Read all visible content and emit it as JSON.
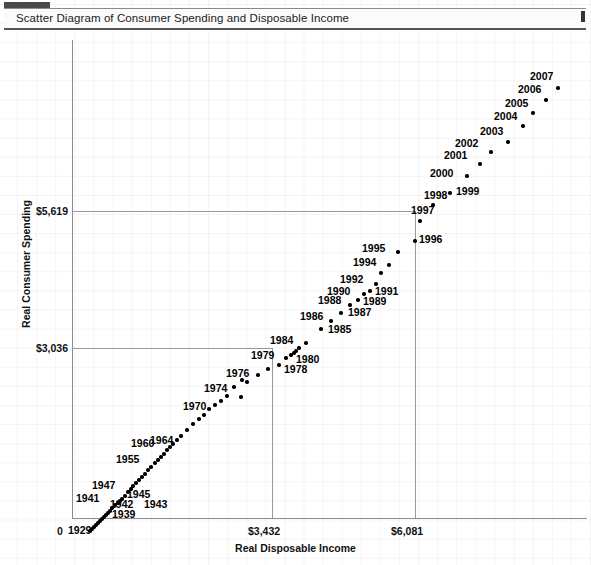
{
  "window": {
    "title": "Scatter Diagram of Consumer Spending and Disposable Income"
  },
  "chart_data": {
    "type": "scatter",
    "title": "Scatter Diagram of Consumer Spending and Disposable Income",
    "xlabel": "Real Disposable Income",
    "ylabel": "Real Consumer Spending",
    "grid": true,
    "legend": "none",
    "xticks": [
      "0",
      "$3,432",
      "$6,081"
    ],
    "xtick_values": [
      0,
      3432,
      6081
    ],
    "yticks": [
      "$3,036",
      "$5,619"
    ],
    "ytick_values": [
      3036,
      5619
    ],
    "xlim": [
      0,
      7600
    ],
    "ylim": [
      0,
      8100
    ],
    "reference_lines": {
      "x": 3432,
      "y": 5619,
      "note": "gridlines meet at the 1996 observation"
    },
    "point_labels_shown": [
      "1929",
      "1939",
      "1941",
      "1942",
      "1943",
      "1945",
      "1947",
      "1955",
      "1960",
      "1964",
      "1970",
      "1974",
      "1976",
      "1978",
      "1979",
      "1980",
      "1984",
      "1985",
      "1986",
      "1987",
      "1988",
      "1989",
      "1990",
      "1991",
      "1992",
      "1994",
      "1995",
      "1996",
      "1997",
      "1998",
      "1999",
      "2000",
      "2001",
      "2002",
      "2003",
      "2004",
      "2005",
      "2006",
      "2007"
    ],
    "points": [
      {
        "year": "1929",
        "x": 780,
        "y": 750,
        "px": 90,
        "py": 501,
        "label": "1929",
        "lx": 68,
        "ly": 500,
        "lw": 30
      },
      {
        "year": "1930",
        "x": 800,
        "y": 770,
        "px": 92,
        "py": 499,
        "label": null
      },
      {
        "year": "1931",
        "x": 820,
        "y": 790,
        "px": 94,
        "py": 497,
        "label": null
      },
      {
        "year": "1932",
        "x": 840,
        "y": 810,
        "px": 96,
        "py": 495,
        "label": null
      },
      {
        "year": "1933",
        "x": 860,
        "y": 830,
        "px": 98,
        "py": 493,
        "label": null
      },
      {
        "year": "1934",
        "x": 885,
        "y": 855,
        "px": 100,
        "py": 491,
        "label": null
      },
      {
        "year": "1935",
        "x": 910,
        "y": 880,
        "px": 102,
        "py": 489,
        "label": null
      },
      {
        "year": "1936",
        "x": 935,
        "y": 905,
        "px": 104,
        "py": 487,
        "label": null
      },
      {
        "year": "1937",
        "x": 960,
        "y": 930,
        "px": 106,
        "py": 485,
        "label": null
      },
      {
        "year": "1938",
        "x": 985,
        "y": 955,
        "px": 108,
        "py": 483,
        "label": null
      },
      {
        "year": "1939",
        "x": 1010,
        "y": 980,
        "px": 110,
        "py": 481,
        "label": "1939",
        "lx": 112,
        "ly": 484,
        "lw": 30
      },
      {
        "year": "1940",
        "x": 1040,
        "y": 1010,
        "px": 112,
        "py": 478,
        "label": null
      },
      {
        "year": "1941",
        "x": 1070,
        "y": 1040,
        "px": 115,
        "py": 475,
        "label": "1941",
        "lx": 76,
        "ly": 468,
        "lw": 30
      },
      {
        "year": "1942",
        "x": 1105,
        "y": 1060,
        "px": 118,
        "py": 473,
        "label": "1942",
        "lx": 110,
        "ly": 474,
        "lw": 30
      },
      {
        "year": "1943",
        "x": 1125,
        "y": 1075,
        "px": 120,
        "py": 471,
        "label": "1943",
        "lx": 144,
        "ly": 474,
        "lw": 30
      },
      {
        "year": "1944",
        "x": 1150,
        "y": 1095,
        "px": 122,
        "py": 469,
        "label": null
      },
      {
        "year": "1945",
        "x": 1180,
        "y": 1125,
        "px": 125,
        "py": 466,
        "label": "1945",
        "lx": 127,
        "ly": 464,
        "lw": 30
      },
      {
        "year": "1946",
        "x": 1215,
        "y": 1160,
        "px": 128,
        "py": 462,
        "label": null
      },
      {
        "year": "1947",
        "x": 1245,
        "y": 1190,
        "px": 131,
        "py": 459,
        "label": "1947",
        "lx": 92,
        "ly": 455,
        "lw": 30
      },
      {
        "year": "1948",
        "x": 1275,
        "y": 1215,
        "px": 133,
        "py": 456,
        "label": null
      },
      {
        "year": "1949",
        "x": 1300,
        "y": 1240,
        "px": 136,
        "py": 453,
        "label": null
      },
      {
        "year": "1950",
        "x": 1335,
        "y": 1275,
        "px": 139,
        "py": 450,
        "label": null
      },
      {
        "year": "1951",
        "x": 1370,
        "y": 1300,
        "px": 142,
        "py": 447,
        "label": null
      },
      {
        "year": "1952",
        "x": 1400,
        "y": 1330,
        "px": 145,
        "py": 444,
        "label": null
      },
      {
        "year": "1953",
        "x": 1435,
        "y": 1365,
        "px": 148,
        "py": 440,
        "label": null
      },
      {
        "year": "1954",
        "x": 1465,
        "y": 1395,
        "px": 151,
        "py": 437,
        "label": null
      },
      {
        "year": "1955",
        "x": 1505,
        "y": 1440,
        "px": 155,
        "py": 433,
        "label": "1955",
        "lx": 116,
        "ly": 429,
        "lw": 30
      },
      {
        "year": "1956",
        "x": 1545,
        "y": 1470,
        "px": 158,
        "py": 430,
        "label": null
      },
      {
        "year": "1957",
        "x": 1575,
        "y": 1500,
        "px": 161,
        "py": 427,
        "label": null
      },
      {
        "year": "1958",
        "x": 1600,
        "y": 1525,
        "px": 164,
        "py": 424,
        "label": null
      },
      {
        "year": "1959",
        "x": 1640,
        "y": 1565,
        "px": 167,
        "py": 420,
        "label": null
      },
      {
        "year": "1960",
        "x": 1670,
        "y": 1595,
        "px": 170,
        "py": 417,
        "label": "1960",
        "lx": 131,
        "ly": 413,
        "lw": 30
      },
      {
        "year": "1961",
        "x": 1705,
        "y": 1625,
        "px": 173,
        "py": 414,
        "label": null
      },
      {
        "year": "1962",
        "x": 1750,
        "y": 1670,
        "px": 177,
        "py": 410,
        "label": null
      },
      {
        "year": "1963",
        "x": 1790,
        "y": 1710,
        "px": 181,
        "py": 406,
        "label": null
      },
      {
        "year": "1964",
        "x": 1860,
        "y": 1775,
        "px": 187,
        "py": 400,
        "label": "1964",
        "lx": 150,
        "ly": 410,
        "lw": 30
      },
      {
        "year": "1965",
        "x": 1930,
        "y": 1845,
        "px": 193,
        "py": 394,
        "label": null
      },
      {
        "year": "1966",
        "x": 1995,
        "y": 1905,
        "px": 199,
        "py": 389,
        "label": null
      },
      {
        "year": "1967",
        "x": 2050,
        "y": 1950,
        "px": 204,
        "py": 385,
        "label": null
      },
      {
        "year": "1968",
        "x": 2110,
        "y": 2015,
        "px": 209,
        "py": 379,
        "label": null
      },
      {
        "year": "1969",
        "x": 2170,
        "y": 2065,
        "px": 215,
        "py": 375,
        "label": null
      },
      {
        "year": "1970",
        "x": 2240,
        "y": 2105,
        "px": 221,
        "py": 371,
        "label": "1970",
        "lx": 183,
        "ly": 376,
        "lw": 30
      },
      {
        "year": "1971",
        "x": 2310,
        "y": 2165,
        "px": 227,
        "py": 366,
        "label": null
      },
      {
        "year": "1972",
        "x": 2400,
        "y": 2265,
        "px": 234,
        "py": 357,
        "label": null
      },
      {
        "year": "1973",
        "x": 2500,
        "y": 2350,
        "px": 242,
        "py": 350,
        "label": null
      },
      {
        "year": "1974",
        "x": 2490,
        "y": 2330,
        "px": 241,
        "py": 367,
        "label": "1974",
        "lx": 204,
        "ly": 358,
        "lw": 30
      },
      {
        "year": "1975",
        "x": 2530,
        "y": 2370,
        "px": 247,
        "py": 352,
        "label": null
      },
      {
        "year": "1976",
        "x": 2630,
        "y": 2475,
        "px": 258,
        "py": 345,
        "label": "1976",
        "lx": 226,
        "ly": 343,
        "lw": 30
      },
      {
        "year": "1977",
        "x": 2720,
        "y": 2565,
        "px": 268,
        "py": 339,
        "label": null
      },
      {
        "year": "1978",
        "x": 2830,
        "y": 2670,
        "px": 279,
        "py": 335,
        "label": "1978",
        "lx": 284,
        "ly": 339,
        "lw": 30
      },
      {
        "year": "1979",
        "x": 2890,
        "y": 2740,
        "px": 286,
        "py": 328,
        "label": "1979",
        "lx": 251,
        "ly": 325,
        "lw": 30
      },
      {
        "year": "1980",
        "x": 2900,
        "y": 2730,
        "px": 291,
        "py": 325,
        "label": "1980",
        "lx": 296,
        "ly": 329,
        "lw": 30
      },
      {
        "year": "1981",
        "x": 2940,
        "y": 2760,
        "px": 294,
        "py": 323,
        "label": null
      },
      {
        "year": "1982",
        "x": 2960,
        "y": 2790,
        "px": 296,
        "py": 321,
        "label": null
      },
      {
        "year": "1983",
        "x": 3010,
        "y": 2865,
        "px": 299,
        "py": 318,
        "label": null
      },
      {
        "year": "1984",
        "x": 3100,
        "y": 2960,
        "px": 306,
        "py": 313,
        "label": "1984",
        "lx": 270,
        "ly": 310,
        "lw": 30
      },
      {
        "year": "1985",
        "x": 3230,
        "y": 3060,
        "px": 321,
        "py": 299,
        "label": "1985",
        "lx": 328,
        "ly": 299,
        "lw": 30
      },
      {
        "year": "1986",
        "x": 3320,
        "y": 3180,
        "px": 331,
        "py": 291,
        "label": "1986",
        "lx": 300,
        "ly": 286,
        "lw": 30
      },
      {
        "year": "1987",
        "x": 3410,
        "y": 3280,
        "px": 341,
        "py": 283,
        "label": "1987",
        "lx": 348,
        "ly": 282,
        "lw": 30
      },
      {
        "year": "1988",
        "x": 3520,
        "y": 3395,
        "px": 350,
        "py": 275,
        "label": "1988",
        "lx": 318,
        "ly": 270,
        "lw": 30
      },
      {
        "year": "1989",
        "x": 3600,
        "y": 3460,
        "px": 358,
        "py": 270,
        "label": "1989",
        "lx": 363,
        "ly": 271,
        "lw": 30
      },
      {
        "year": "1990",
        "x": 3680,
        "y": 3520,
        "px": 364,
        "py": 264,
        "label": "1990",
        "lx": 327,
        "ly": 261,
        "lw": 30
      },
      {
        "year": "1991",
        "x": 3700,
        "y": 3525,
        "px": 370,
        "py": 261,
        "label": "1991",
        "lx": 375,
        "ly": 261,
        "lw": 30
      },
      {
        "year": "1992",
        "x": 3790,
        "y": 3610,
        "px": 376,
        "py": 254,
        "label": "1992",
        "lx": 340,
        "ly": 249,
        "lw": 30
      },
      {
        "year": "1993",
        "x": 3860,
        "y": 3700,
        "px": 381,
        "py": 243,
        "label": null
      },
      {
        "year": "1994",
        "x": 3930,
        "y": 3810,
        "px": 389,
        "py": 235,
        "label": "1994",
        "lx": 353,
        "ly": 232,
        "lw": 30
      },
      {
        "year": "1995",
        "x": 4020,
        "y": 3910,
        "px": 398,
        "py": 222,
        "label": "1995",
        "lx": 362,
        "ly": 218,
        "lw": 30
      },
      {
        "year": "1996",
        "x": 6081,
        "y": 5619,
        "px": 415,
        "py": 211,
        "label": "1996",
        "lx": 419,
        "ly": 209,
        "lw": 30
      },
      {
        "year": "1997",
        "x": 4310,
        "y": 4270,
        "px": 420,
        "py": 191,
        "label": "1997",
        "lx": 411,
        "ly": 180,
        "lw": 30
      },
      {
        "year": "1998",
        "x": 4470,
        "y": 4460,
        "px": 433,
        "py": 175,
        "label": "1998",
        "lx": 424,
        "ly": 165,
        "lw": 30
      },
      {
        "year": "1999",
        "x": 4620,
        "y": 4680,
        "px": 450,
        "py": 163,
        "label": "1999",
        "lx": 456,
        "ly": 161,
        "lw": 30
      },
      {
        "year": "2000",
        "x": 4800,
        "y": 4890,
        "px": 467,
        "py": 146,
        "label": "2000",
        "lx": 430,
        "ly": 143,
        "lw": 30
      },
      {
        "year": "2001",
        "x": 4910,
        "y": 4990,
        "px": 480,
        "py": 134,
        "label": "2001",
        "lx": 444,
        "ly": 125,
        "lw": 30
      },
      {
        "year": "2002",
        "x": 5060,
        "y": 5110,
        "px": 491,
        "py": 122,
        "label": "2002",
        "lx": 455,
        "ly": 113,
        "lw": 30
      },
      {
        "year": "2003",
        "x": 5200,
        "y": 5250,
        "px": 508,
        "py": 112,
        "label": "2003",
        "lx": 480,
        "ly": 101,
        "lw": 30
      },
      {
        "year": "2004",
        "x": 5380,
        "y": 5430,
        "px": 523,
        "py": 96,
        "label": "2004",
        "lx": 494,
        "ly": 86,
        "lw": 30
      },
      {
        "year": "2005",
        "x": 5500,
        "y": 5600,
        "px": 533,
        "py": 83,
        "label": "2005",
        "lx": 505,
        "ly": 73,
        "lw": 30
      },
      {
        "year": "2006",
        "x": 5680,
        "y": 5770,
        "px": 546,
        "py": 70,
        "label": "2006",
        "lx": 518,
        "ly": 59,
        "lw": 30
      },
      {
        "year": "2007",
        "x": 5810,
        "y": 5890,
        "px": 558,
        "py": 58,
        "label": "2007",
        "lx": 530,
        "ly": 46,
        "lw": 30
      }
    ]
  }
}
